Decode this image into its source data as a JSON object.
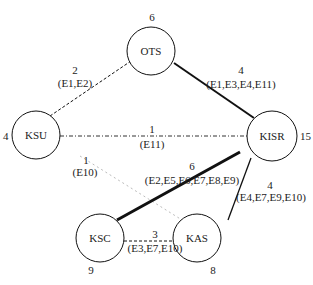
{
  "nodes": {
    "OTS": {
      "label": "OTS",
      "degree": "6"
    },
    "KSU": {
      "label": "KSU",
      "degree": "4"
    },
    "KISR": {
      "label": "KISR",
      "degree": "15"
    },
    "KSC": {
      "label": "KSC",
      "degree": "9"
    },
    "KAS": {
      "label": "KAS",
      "degree": "8"
    }
  },
  "edges": {
    "ksu_ots": {
      "from": "KSU",
      "to": "OTS",
      "weight": "2",
      "experts": "(E1,E2)",
      "style": "dashed"
    },
    "ots_kisr": {
      "from": "OTS",
      "to": "KISR",
      "weight": "4",
      "experts": "(E1,E3,E4,E11)",
      "style": "solid-medium"
    },
    "ksu_kisr": {
      "from": "KSU",
      "to": "KISR",
      "weight": "1",
      "experts": "(E11)",
      "style": "dash-dot"
    },
    "ksu_kas": {
      "from": "KSU",
      "to": "KAS",
      "weight": "1",
      "experts": "(E10)",
      "style": "dotted-light"
    },
    "ksc_kisr": {
      "from": "KSC",
      "to": "KISR",
      "weight": "6",
      "experts": "(E2,E5,E6,E7,E8,E9)",
      "style": "solid-thick"
    },
    "kisr_kas": {
      "from": "KISR",
      "to": "KAS",
      "weight": "4",
      "experts": "(E4,E7,E9,E10)",
      "style": "solid-thin"
    },
    "ksc_kas": {
      "from": "KSC",
      "to": "KAS",
      "weight": "3",
      "experts": "(E3,E7,E10)",
      "style": "dashed"
    }
  },
  "colors": {
    "line": "#111111",
    "light_line": "#bbbbbb",
    "text": "#222222"
  }
}
